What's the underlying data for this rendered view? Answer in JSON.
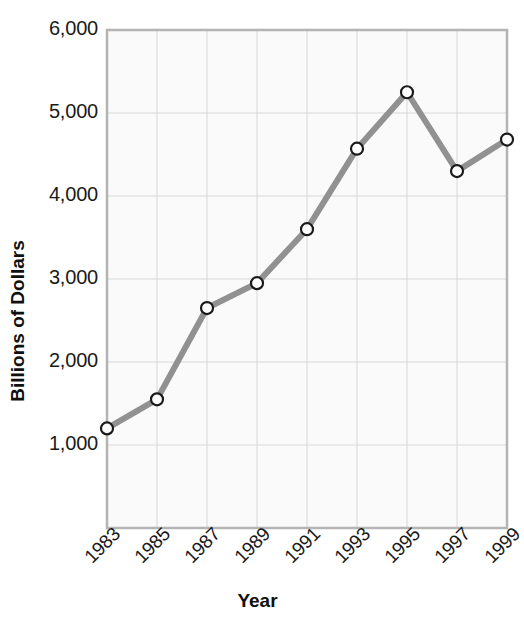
{
  "chart_data": {
    "type": "line",
    "title": "",
    "xlabel": "Year",
    "ylabel": "Billions of Dollars",
    "x": [
      1983,
      1985,
      1987,
      1989,
      1991,
      1993,
      1995,
      1997,
      1999
    ],
    "categories": [
      "1983",
      "1985",
      "1987",
      "1989",
      "1991",
      "1993",
      "1995",
      "1997",
      "1999"
    ],
    "values": [
      1200,
      1550,
      2650,
      2950,
      3600,
      4570,
      5250,
      4300,
      4680
    ],
    "series": [
      {
        "name": "Billions of Dollars",
        "values": [
          1200,
          1550,
          2650,
          2950,
          3600,
          4570,
          5250,
          4300,
          4680
        ]
      }
    ],
    "xlim": [
      1983,
      1999
    ],
    "ylim": [
      0,
      6000
    ],
    "ytick_labels": [
      "6,000",
      "5,000",
      "4,000",
      "3,000",
      "2,000",
      "1,000"
    ],
    "ytick_values": [
      6000,
      5000,
      4000,
      3000,
      2000,
      1000
    ],
    "xtick_labels": [
      "1983",
      "1985",
      "1987",
      "1989",
      "1991",
      "1993",
      "1995",
      "1997",
      "1999"
    ],
    "grid": true,
    "legend": "none",
    "line_color": "#919191",
    "marker_face_color": "#ffffff",
    "marker_edge_color": "#1a1a1a",
    "plot_bg_color": "#fafafa",
    "grid_color": "#d8d8d8",
    "border_color": "#b4b4b4",
    "text_color": "#1a1a1a"
  }
}
